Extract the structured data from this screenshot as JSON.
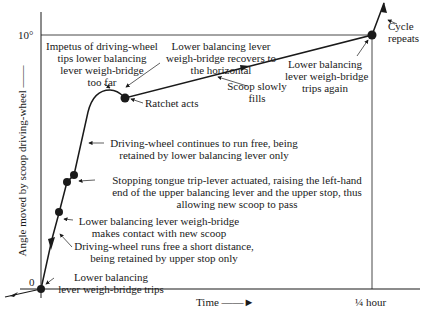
{
  "axes": {
    "y_label": "Angle moved by scoop driving-wheel ——",
    "y_top_tick": "10°",
    "y_origin_tick": "0",
    "x_label": "Time ——►",
    "x_end_tick": "¼ hour"
  },
  "annotations": {
    "impetus": "Impetus of driving-wheel\ntips lower balancing\nlever weigh-bridge\ntoo far",
    "recovers": "Lower balancing lever\nweigh-bridge recovers to\nthe horizontal",
    "ratchet": "Ratchet acts",
    "scoop_fills": "Scoop slowly\nfills",
    "trips_again": "Lower balancing\nlever weigh-bridge\ntrips again",
    "cycle": "Cycle\nrepeats",
    "runs_free": "Driving-wheel continues to run free, being\nretained by lower balancing lever only",
    "stopping": "Stopping tongue trip-lever actuated, raising the left-hand\nend of the upper balancing lever and the upper stop, thus\nallowing new scoop to pass",
    "contact": "Lower balancing lever weigh-bridge\nmakes contact with new scoop",
    "short_distance": "Driving-wheel runs free a short distance,\nbeing retained by upper stop only",
    "trips": "Lower balancing\nlever weigh-bridge trips"
  },
  "colors": {
    "ink": "#1a1a1a",
    "background": "#ffffff"
  }
}
